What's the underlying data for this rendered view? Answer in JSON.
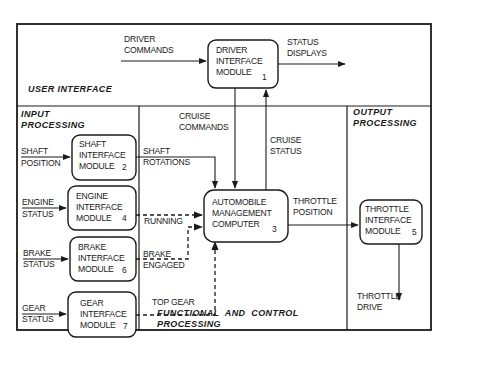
{
  "diagram": {
    "sections": {
      "user_interface": "USER INTERFACE",
      "input_processing": [
        "INPUT",
        "PROCESSING"
      ],
      "functional_processing": [
        "FUNCTIONAL  AND  CONTROL",
        "PROCESSING"
      ],
      "output_processing": [
        "OUTPUT",
        "PROCESSING"
      ]
    },
    "modules": {
      "driver": {
        "lines": [
          "DRIVER",
          "INTERFACE",
          "MODULE"
        ],
        "number": "1"
      },
      "shaft": {
        "lines": [
          "SHAFT",
          "INTERFACE",
          "MODULE"
        ],
        "number": "2"
      },
      "amc": {
        "lines": [
          "AUTOMOBILE",
          "MANAGEMENT",
          "COMPUTER"
        ],
        "number": "3"
      },
      "engine": {
        "lines": [
          "ENGINE",
          "INTERFACE",
          "MODULE"
        ],
        "number": "4"
      },
      "throttle": {
        "lines": [
          "THROTTLE",
          "INTERFACE",
          "MODULE"
        ],
        "number": "5"
      },
      "brake": {
        "lines": [
          "BRAKE",
          "INTERFACE",
          "MODULE"
        ],
        "number": "6"
      },
      "gear": {
        "lines": [
          "GEAR",
          "INTERFACE",
          "MODULE"
        ],
        "number": "7"
      }
    },
    "flows": {
      "driver_commands": [
        "DRIVER",
        "COMMANDS"
      ],
      "status_displays": [
        "STATUS",
        "DISPLAYS"
      ],
      "cruise_commands": [
        "CRUISE",
        "COMMANDS"
      ],
      "cruise_status": [
        "CRUISE",
        "STATUS"
      ],
      "shaft_position": [
        "SHAFT",
        "POSITION"
      ],
      "engine_status": [
        "ENGINE",
        "STATUS"
      ],
      "brake_status": [
        "BRAKE",
        "STATUS"
      ],
      "gear_status": [
        "GEAR",
        "STATUS"
      ],
      "shaft_rotations": [
        "SHAFT",
        "ROTATIONS"
      ],
      "running": "RUNNING",
      "brake_engaged": [
        "BRAKE",
        "ENGAGED"
      ],
      "top_gear": "TOP GEAR",
      "throttle_position": [
        "THROTTLE",
        "POSITION"
      ],
      "throttle_drive": [
        "THROTTLE",
        "DRIVE"
      ]
    }
  }
}
